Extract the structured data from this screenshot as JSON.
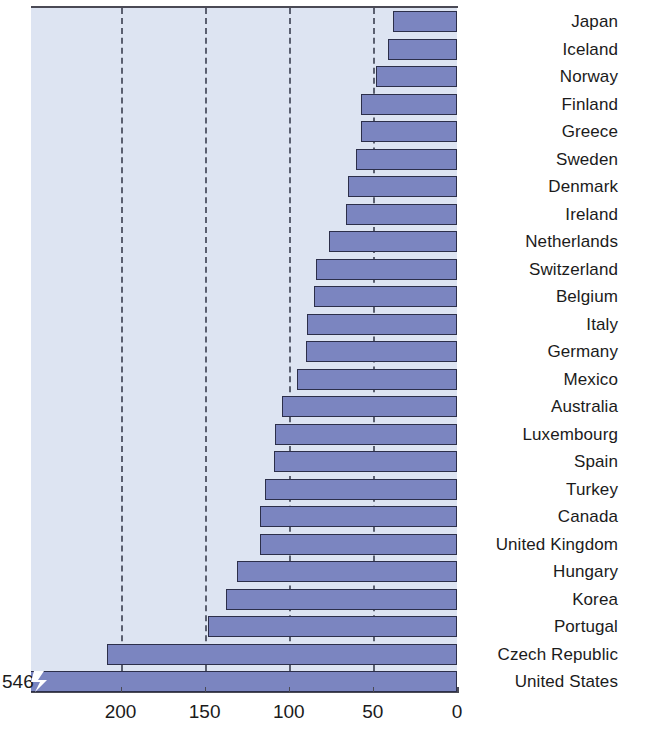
{
  "chart_data": {
    "type": "bar",
    "orientation": "horizontal",
    "title": "",
    "subtitle": "",
    "xlabel": "",
    "ylabel": "",
    "xlim": [
      0,
      254
    ],
    "axis_direction": "reversed",
    "grid": true,
    "gridlines": [
      200,
      150,
      100,
      50
    ],
    "xticks": [
      200,
      150,
      100,
      50,
      0
    ],
    "xtick_labels": [
      "200",
      "150",
      "100",
      "50",
      "0"
    ],
    "legend": "none",
    "categories": [
      "Japan",
      "Iceland",
      "Norway",
      "Finland",
      "Greece",
      "Sweden",
      "Denmark",
      "Ireland",
      "Netherlands",
      "Switzerland",
      "Belgium",
      "Italy",
      "Germany",
      "Mexico",
      "Australia",
      "Luxembourg",
      "Spain",
      "Turkey",
      "Canada",
      "United Kingdom",
      "Hungary",
      "Korea",
      "Portugal",
      "Czech Republic",
      "United States"
    ],
    "values": [
      38,
      41,
      48,
      57,
      57,
      60,
      65,
      66,
      76,
      84,
      85,
      89,
      90,
      95,
      104,
      108,
      109,
      114,
      117,
      117,
      131,
      137,
      148,
      208,
      546
    ],
    "broken_bars": [
      "United States"
    ],
    "annotations": [
      {
        "text": "546",
        "category": "United States",
        "position": "left-of-axis"
      }
    ],
    "colors": {
      "bar_fill": "#7b85c0",
      "bar_edge": "#2c2f4a",
      "plot_background": "#dde4f2",
      "gridline": "#5a5f70",
      "axis": "#4a4a55",
      "text": "#1b1b1b",
      "page_background": "#ffffff"
    }
  }
}
